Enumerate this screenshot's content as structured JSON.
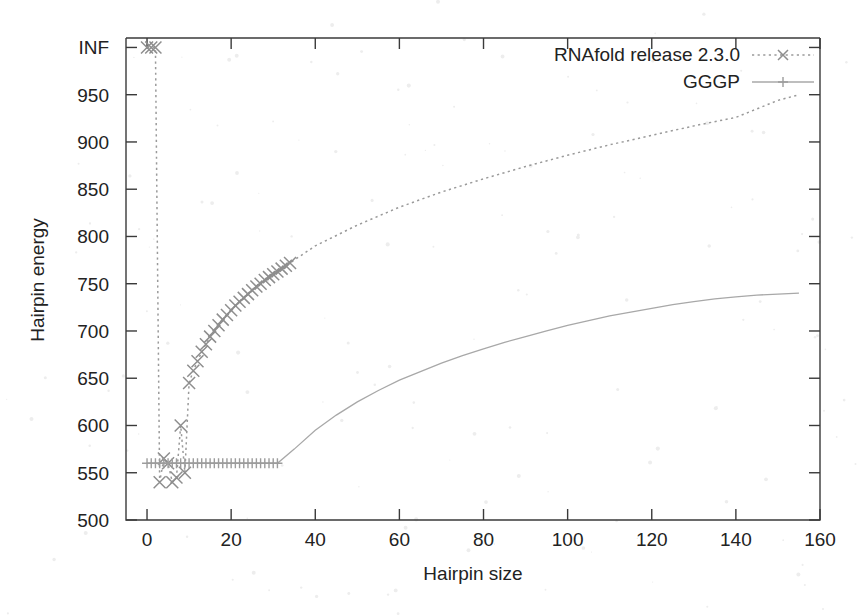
{
  "chart_data": {
    "type": "line",
    "title": "",
    "subtitle": "",
    "xlabel": "Hairpin size",
    "ylabel": "Hairpin energy",
    "xlim": [
      -5,
      160
    ],
    "ylim": [
      500,
      1010
    ],
    "grid": false,
    "legend_position": "top-right",
    "x_ticks": [
      0,
      20,
      40,
      60,
      80,
      100,
      120,
      140,
      160
    ],
    "x_tick_labels": [
      "0",
      "20",
      "40",
      "60",
      "80",
      "100",
      "120",
      "140",
      "160"
    ],
    "y_ticks": [
      500,
      550,
      600,
      650,
      700,
      750,
      800,
      850,
      900,
      950,
      1000
    ],
    "y_tick_labels": [
      "500",
      "550",
      "600",
      "650",
      "700",
      "750",
      "800",
      "850",
      "900",
      "950",
      "INF"
    ],
    "y_axis_top_is_infinity": true,
    "series": [
      {
        "name": "RNAfold release 2.3.0",
        "style": "dashed",
        "marker": "x",
        "marker_symbol": "×",
        "color": "#9a9a9a",
        "points": [
          [
            0,
            1000
          ],
          [
            1,
            1000
          ],
          [
            2,
            1000
          ],
          [
            3,
            540
          ],
          [
            4,
            565
          ],
          [
            5,
            560
          ],
          [
            6,
            540
          ],
          [
            7,
            545
          ],
          [
            8,
            600
          ],
          [
            9,
            550
          ],
          [
            10,
            645
          ],
          [
            11,
            658
          ],
          [
            12,
            668
          ],
          [
            13,
            678
          ],
          [
            14,
            686
          ],
          [
            15,
            694
          ],
          [
            16,
            700
          ],
          [
            17,
            706
          ],
          [
            18,
            712
          ],
          [
            19,
            717
          ],
          [
            20,
            722
          ],
          [
            21,
            727
          ],
          [
            22,
            731
          ],
          [
            23,
            735
          ],
          [
            24,
            739
          ],
          [
            25,
            743
          ],
          [
            26,
            747
          ],
          [
            27,
            750
          ],
          [
            28,
            754
          ],
          [
            29,
            757
          ],
          [
            30,
            760
          ],
          [
            31,
            763
          ],
          [
            32,
            766
          ],
          [
            33,
            769
          ],
          [
            34,
            772
          ],
          [
            40,
            790
          ],
          [
            50,
            812
          ],
          [
            60,
            831
          ],
          [
            70,
            847
          ],
          [
            80,
            861
          ],
          [
            90,
            874
          ],
          [
            100,
            886
          ],
          [
            110,
            897
          ],
          [
            120,
            907
          ],
          [
            130,
            917
          ],
          [
            140,
            926
          ],
          [
            150,
            944
          ],
          [
            155,
            950
          ]
        ],
        "markers_end_at_x": 34
      },
      {
        "name": "GGGP",
        "style": "solid",
        "marker": "plus",
        "marker_symbol": "+",
        "color": "#a8a8a8",
        "points": [
          [
            0,
            560
          ],
          [
            1,
            560
          ],
          [
            2,
            560
          ],
          [
            3,
            560
          ],
          [
            4,
            560
          ],
          [
            5,
            560
          ],
          [
            6,
            560
          ],
          [
            7,
            560
          ],
          [
            8,
            560
          ],
          [
            9,
            560
          ],
          [
            10,
            560
          ],
          [
            11,
            560
          ],
          [
            12,
            560
          ],
          [
            13,
            560
          ],
          [
            14,
            560
          ],
          [
            15,
            560
          ],
          [
            16,
            560
          ],
          [
            17,
            560
          ],
          [
            18,
            560
          ],
          [
            19,
            560
          ],
          [
            20,
            560
          ],
          [
            21,
            560
          ],
          [
            22,
            560
          ],
          [
            23,
            560
          ],
          [
            24,
            560
          ],
          [
            25,
            560
          ],
          [
            26,
            560
          ],
          [
            27,
            560
          ],
          [
            28,
            560
          ],
          [
            29,
            560
          ],
          [
            30,
            560
          ],
          [
            31,
            560
          ],
          [
            35,
            575
          ],
          [
            40,
            595
          ],
          [
            45,
            611
          ],
          [
            50,
            625
          ],
          [
            55,
            637
          ],
          [
            60,
            648
          ],
          [
            65,
            657
          ],
          [
            70,
            666
          ],
          [
            75,
            674
          ],
          [
            80,
            681
          ],
          [
            85,
            688
          ],
          [
            90,
            694
          ],
          [
            95,
            700
          ],
          [
            100,
            706
          ],
          [
            105,
            711
          ],
          [
            110,
            716
          ],
          [
            115,
            720
          ],
          [
            120,
            724
          ],
          [
            125,
            728
          ],
          [
            130,
            731
          ],
          [
            135,
            734
          ],
          [
            140,
            736
          ],
          [
            145,
            738
          ],
          [
            150,
            739
          ],
          [
            155,
            740
          ]
        ],
        "markers_end_at_x": 31,
        "flat_value": 560,
        "flat_until_x": 31
      }
    ],
    "annotations": []
  },
  "legend": {
    "entries": [
      {
        "label": "RNAfold release 2.3.0",
        "style": "dashed",
        "marker": "×"
      },
      {
        "label": "GGGP",
        "style": "solid",
        "marker": "+"
      }
    ]
  },
  "axes": {
    "x_title": "Hairpin size",
    "y_title": "Hairpin energy"
  },
  "colors": {
    "axis": "#3a3a3a",
    "text": "#222222",
    "series_rnafold": "#9a9a9a",
    "series_gggp": "#a8a8a8",
    "background": "#ffffff"
  }
}
